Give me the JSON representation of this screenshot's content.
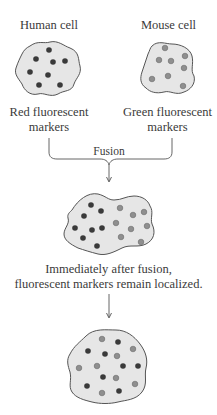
{
  "cells": {
    "human": {
      "title": "Human cell",
      "caption_line1": "Red fluorescent",
      "caption_line2": "markers"
    },
    "mouse": {
      "title": "Mouse cell",
      "caption_line1": "Green fluorescent",
      "caption_line2": "markers"
    }
  },
  "fusion": {
    "label": "Fusion"
  },
  "hybrid_early": {
    "caption_line1": "Immediately after fusion,",
    "caption_line2": "fluorescent markers remain localized."
  },
  "colors": {
    "cell_fill": "#e6e6e6",
    "cell_outline": "#555555",
    "red_marker": "#3a3a3a",
    "green_marker": "#8f8f8f",
    "text": "#3a3a3a"
  }
}
